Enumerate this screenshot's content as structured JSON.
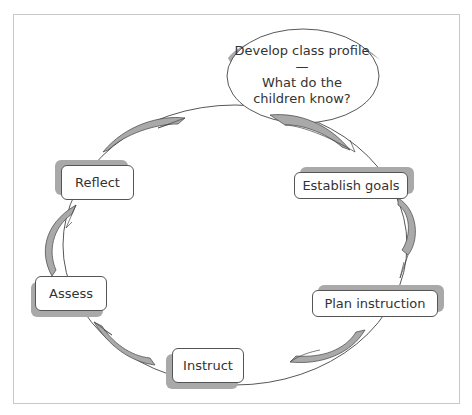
{
  "diagram": {
    "type": "cycle",
    "center_node": {
      "line1": "Develop class profile—",
      "line2": "What do the",
      "line3": "children know?"
    },
    "nodes": [
      {
        "id": "establish-goals",
        "label": "Establish goals"
      },
      {
        "id": "plan-instruction",
        "label": "Plan instruction"
      },
      {
        "id": "instruct",
        "label": "Instruct"
      },
      {
        "id": "assess",
        "label": "Assess"
      },
      {
        "id": "reflect",
        "label": "Reflect"
      }
    ],
    "edges": [
      {
        "from": "Develop class profile",
        "to": "Establish goals"
      },
      {
        "from": "Establish goals",
        "to": "Plan instruction"
      },
      {
        "from": "Plan instruction",
        "to": "Instruct"
      },
      {
        "from": "Instruct",
        "to": "Assess"
      },
      {
        "from": "Assess",
        "to": "Reflect"
      },
      {
        "from": "Reflect",
        "to": "Develop class profile"
      }
    ],
    "colors": {
      "arrow_fill": "#a9a9a9",
      "outline": "#444444",
      "frame": "#c9c9c9"
    }
  }
}
